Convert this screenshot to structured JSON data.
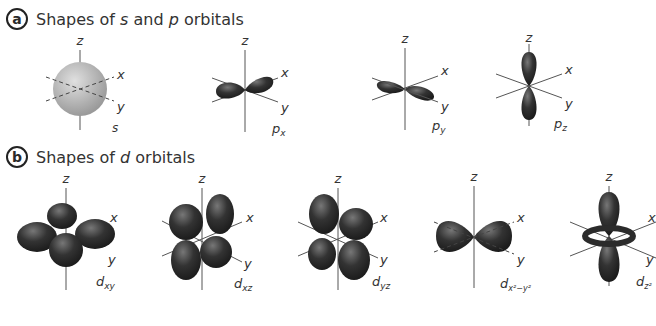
{
  "sections": [
    {
      "badge": "a",
      "title_pre": "Shapes of ",
      "title_i1": "s",
      "title_mid": " and ",
      "title_i2": "p",
      "title_post": " orbitals",
      "orbitals": [
        {
          "name": "s",
          "sub": ""
        },
        {
          "name": "p",
          "sub": "x"
        },
        {
          "name": "p",
          "sub": "y"
        },
        {
          "name": "p",
          "sub": "z"
        }
      ]
    },
    {
      "badge": "b",
      "title_pre": "Shapes of ",
      "title_i1": "d",
      "title_post": " orbitals",
      "orbitals": [
        {
          "name": "d",
          "sub": "xy"
        },
        {
          "name": "d",
          "sub": "xz"
        },
        {
          "name": "d",
          "sub": "yz"
        },
        {
          "name": "d",
          "sub": "x²−y²"
        },
        {
          "name": "d",
          "sub": "z²"
        }
      ]
    }
  ],
  "axes": {
    "x": "x",
    "y": "y",
    "z": "z"
  },
  "colors": {
    "lobe_dark": "#2b2b2b",
    "lobe_light": "#6a6a6a",
    "s_sphere": "#b9b9b9",
    "axis": "#555555"
  }
}
